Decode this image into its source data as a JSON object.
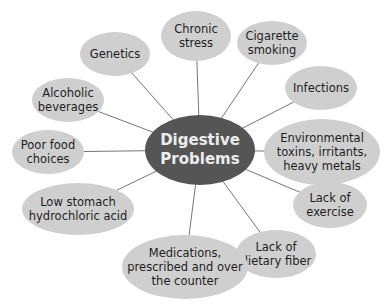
{
  "diagram": {
    "type": "mind-map",
    "colors": {
      "outer_fill": "#cfcfcf",
      "center_fill": "#555555",
      "center_text": "#ececec",
      "text": "#1e1e1e",
      "line": "#777777"
    },
    "center": {
      "label": "Digestive\nProblems",
      "cx": 200,
      "cy": 150,
      "rx": 55,
      "ry": 35
    },
    "nodes": [
      {
        "id": "genetics",
        "label": "Genetics",
        "cx": 115,
        "cy": 54,
        "rx": 35,
        "ry": 22
      },
      {
        "id": "chronic-stress",
        "label": "Chronic\nstress",
        "cx": 196,
        "cy": 36,
        "rx": 35,
        "ry": 25
      },
      {
        "id": "cigarette-smoking",
        "label": "Cigarette\nsmoking",
        "cx": 272,
        "cy": 43,
        "rx": 35,
        "ry": 22
      },
      {
        "id": "infections",
        "label": "Infections",
        "cx": 321,
        "cy": 88,
        "rx": 36,
        "ry": 22
      },
      {
        "id": "alcoholic-beverages",
        "label": "Alcoholic\nbeverages",
        "cx": 68,
        "cy": 100,
        "rx": 36,
        "ry": 22
      },
      {
        "id": "environmental-toxins",
        "label": "Environmental\ntoxins, irritants,\nheavy metals",
        "cx": 322,
        "cy": 152,
        "rx": 58,
        "ry": 33
      },
      {
        "id": "poor-food-choices",
        "label": "Poor food\nchoices",
        "cx": 48,
        "cy": 152,
        "rx": 36,
        "ry": 22
      },
      {
        "id": "lack-of-exercise",
        "label": "Lack of\nexercise",
        "cx": 330,
        "cy": 205,
        "rx": 37,
        "ry": 23
      },
      {
        "id": "low-stomach-acid",
        "label": "Low stomach\nhydrochloric acid",
        "cx": 78,
        "cy": 209,
        "rx": 56,
        "ry": 26
      },
      {
        "id": "lack-of-dietary-fiber",
        "label": "Lack of\ndietary fiber",
        "cx": 276,
        "cy": 254,
        "rx": 40,
        "ry": 24
      },
      {
        "id": "medications",
        "label": "Medications,\nprescribed and over\nthe counter",
        "cx": 185,
        "cy": 267,
        "rx": 63,
        "ry": 32
      }
    ]
  }
}
